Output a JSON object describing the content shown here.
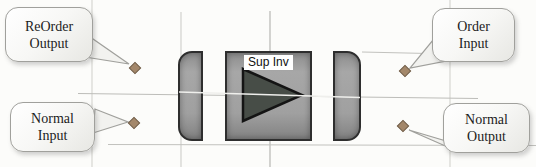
{
  "diagram": {
    "block": {
      "label": "Sup Inv"
    },
    "callouts": [
      {
        "line1": "ReOrder",
        "line2": "Output"
      },
      {
        "line1": "Normal",
        "line2": "Input"
      },
      {
        "line1": "Order",
        "line2": "Input"
      },
      {
        "line1": "Normal",
        "line2": "Output"
      }
    ],
    "colors": {
      "block_fill": "#9c9c9c",
      "block_border": "#2e2e2e",
      "triangle_fill": "#474d47",
      "marker_fill": "#a3876a",
      "marker_border": "#6e5b46",
      "callout_border": "#a0a09c",
      "grid_line": "#c9c9c5"
    }
  }
}
